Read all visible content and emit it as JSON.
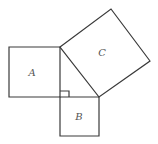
{
  "diagram": {
    "type": "pythagorean-squares",
    "stroke_color": "#3a3a3a",
    "label_color": "#555555",
    "squares": [
      {
        "id": "A",
        "label": "A",
        "points": [
          [
            9,
            47
          ],
          [
            60,
            47
          ],
          [
            60,
            97
          ],
          [
            9,
            97
          ]
        ],
        "label_pos": [
          32,
          76
        ]
      },
      {
        "id": "B",
        "label": "B",
        "points": [
          [
            60,
            97
          ],
          [
            99,
            97
          ],
          [
            99,
            136
          ],
          [
            60,
            136
          ]
        ],
        "label_pos": [
          79,
          120
        ]
      },
      {
        "id": "C",
        "label": "C",
        "points": [
          [
            60,
            47
          ],
          [
            111,
            9
          ],
          [
            150,
            61
          ],
          [
            99,
            97
          ]
        ],
        "label_pos": [
          102,
          56
        ]
      }
    ],
    "right_angle_marker": {
      "points": [
        [
          60,
          91
        ],
        [
          69,
          91
        ],
        [
          69,
          97
        ]
      ]
    }
  }
}
